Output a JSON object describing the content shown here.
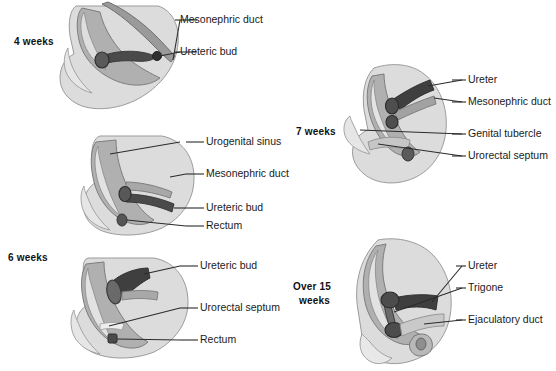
{
  "diagram": {
    "palette": {
      "background": "#ffffff",
      "body_light": "#dcdcdc",
      "tissue_mid": "#b4b4b4",
      "tissue_dark": "#9a9a9a",
      "duct_dark": "#4a4a4a",
      "duct_darkest": "#3a3a3a",
      "outline": "#6e6e6e",
      "leader_line": "#2b2b2b",
      "text": "#1a1a1a"
    }
  },
  "stages": [
    {
      "id": "stage-4-weeks",
      "stage_label": "4 weeks",
      "labels": [
        {
          "text": "Mesonephric duct"
        },
        {
          "text": "Ureteric bud"
        }
      ]
    },
    {
      "id": "stage-6-weeks-upper",
      "stage_label": "6 weeks",
      "labels": [
        {
          "text": "Urogenital sinus"
        },
        {
          "text": "Mesonephric duct"
        },
        {
          "text": "Ureteric bud"
        },
        {
          "text": "Rectum"
        }
      ]
    },
    {
      "id": "stage-6-weeks-lower",
      "stage_label": "",
      "labels": [
        {
          "text": "Ureteric bud"
        },
        {
          "text": "Urorectal septum"
        },
        {
          "text": "Rectum"
        }
      ]
    },
    {
      "id": "stage-7-weeks",
      "stage_label": "7 weeks",
      "labels": [
        {
          "text": "Ureter"
        },
        {
          "text": "Mesonephric duct"
        },
        {
          "text": "Genital tubercle"
        },
        {
          "text": "Urorectal septum"
        }
      ]
    },
    {
      "id": "stage-over-15-weeks",
      "stage_label_line1": "Over 15",
      "stage_label_line2": "weeks",
      "labels": [
        {
          "text": "Ureter"
        },
        {
          "text": "Trigone"
        },
        {
          "text": "Ejaculatory duct"
        }
      ]
    }
  ]
}
